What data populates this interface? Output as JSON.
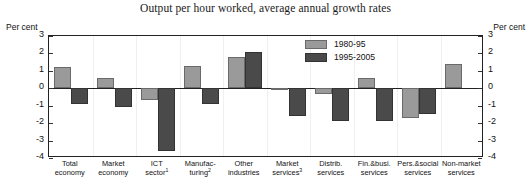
{
  "chart_data": {
    "type": "bar",
    "title": "Output per hour worked, average annual growth rates",
    "xlabel": "",
    "ylabel": "Per cent",
    "ylabel_right": "Per cent",
    "ylim": [
      -4,
      3
    ],
    "yticks": [
      3,
      2,
      1,
      0,
      -1,
      -2,
      -3,
      -4
    ],
    "ytick_labels": [
      "3",
      "2",
      "1",
      "0",
      "-1",
      "-2",
      "-3",
      "-4"
    ],
    "grid": false,
    "legend_position": "upper-center-right",
    "categories": [
      "Total economy",
      "Market economy",
      "ICT sector¹",
      "Manufacturing²",
      "Other industries",
      "Market services³",
      "Distrib. services",
      "Fin.&busi. services",
      "Pers.&social services",
      "Non-market services"
    ],
    "category_lines": [
      [
        "Total",
        "economy"
      ],
      [
        "Market",
        "economy"
      ],
      [
        "ICT",
        "sector"
      ],
      [
        "Manufac-",
        "turing"
      ],
      [
        "Other",
        "industries"
      ],
      [
        "Market",
        "services"
      ],
      [
        "Distrib.",
        "services"
      ],
      [
        "Fin.&busi.",
        "services"
      ],
      [
        "Pers.&social",
        "services"
      ],
      [
        "Non-market",
        "services"
      ]
    ],
    "category_footnotes": [
      "",
      "",
      "1",
      "2",
      "",
      "3",
      "",
      "",
      "",
      ""
    ],
    "series": [
      {
        "name": "1980-95",
        "color": "#9a9a9a",
        "values": [
          1.2,
          0.6,
          -0.7,
          1.3,
          1.8,
          -0.1,
          -0.3,
          0.6,
          -1.7,
          1.4
        ]
      },
      {
        "name": "1995-2005",
        "color": "#4a4a4a",
        "values": [
          -0.9,
          -1.1,
          -3.6,
          -0.9,
          2.1,
          -1.6,
          -1.9,
          -1.9,
          -1.5,
          null
        ]
      }
    ]
  }
}
